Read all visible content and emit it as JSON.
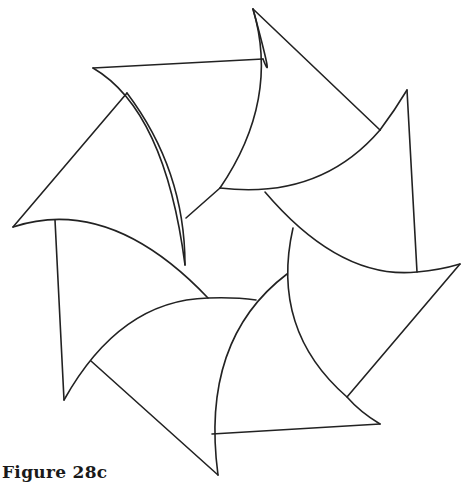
{
  "figure": {
    "caption": "Figure 28c",
    "stroke_color": "#222222",
    "background_color": "#ffffff",
    "shape_count": 7
  }
}
